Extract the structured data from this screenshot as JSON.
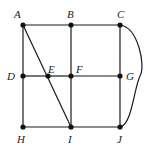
{
  "diagram": {
    "type": "graph",
    "colors": {
      "edge": "#1a1a1a",
      "node": "#111111",
      "label": "#222222",
      "background": "#ffffff"
    },
    "nodes": [
      {
        "id": "A",
        "label": "A",
        "x": 23,
        "y": 25,
        "lx": 14,
        "ly": 18
      },
      {
        "id": "B",
        "label": "B",
        "x": 71,
        "y": 25,
        "lx": 67,
        "ly": 18
      },
      {
        "id": "C",
        "label": "C",
        "x": 120,
        "y": 25,
        "lx": 117,
        "ly": 18
      },
      {
        "id": "D",
        "label": "D",
        "x": 23,
        "y": 76,
        "lx": 7,
        "ly": 80
      },
      {
        "id": "E",
        "label": "E",
        "x": 48,
        "y": 76,
        "lx": 48,
        "ly": 73
      },
      {
        "id": "F",
        "label": "F",
        "x": 71,
        "y": 76,
        "lx": 76,
        "ly": 73
      },
      {
        "id": "G",
        "label": "G",
        "x": 120,
        "y": 76,
        "lx": 126,
        "ly": 80
      },
      {
        "id": "H",
        "label": "H",
        "x": 23,
        "y": 127,
        "lx": 17,
        "ly": 143
      },
      {
        "id": "I",
        "label": "I",
        "x": 71,
        "y": 127,
        "lx": 68,
        "ly": 143
      },
      {
        "id": "J",
        "label": "J",
        "x": 120,
        "y": 127,
        "lx": 117,
        "ly": 143
      }
    ],
    "edges": [
      {
        "from": "A",
        "to": "B"
      },
      {
        "from": "B",
        "to": "C"
      },
      {
        "from": "A",
        "to": "D"
      },
      {
        "from": "D",
        "to": "H"
      },
      {
        "from": "B",
        "to": "F"
      },
      {
        "from": "F",
        "to": "I"
      },
      {
        "from": "C",
        "to": "G"
      },
      {
        "from": "G",
        "to": "J"
      },
      {
        "from": "D",
        "to": "E"
      },
      {
        "from": "E",
        "to": "F"
      },
      {
        "from": "F",
        "to": "G"
      },
      {
        "from": "H",
        "to": "I"
      },
      {
        "from": "I",
        "to": "J"
      },
      {
        "from": "A",
        "to": "I",
        "note": "diagonal passing through E"
      },
      {
        "from": "C",
        "to": "J",
        "curved": true,
        "bulge_x": 140
      }
    ]
  }
}
